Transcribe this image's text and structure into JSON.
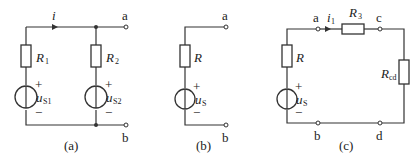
{
  "figures": [
    {
      "caption": "(a)",
      "current": "i",
      "terminals": [
        "a",
        "b"
      ],
      "resistors": [
        {
          "name": "R",
          "sub": "1"
        },
        {
          "name": "R",
          "sub": "2"
        }
      ],
      "sources": [
        {
          "name": "u",
          "sub": "S1",
          "plus": "+",
          "minus": "−"
        },
        {
          "name": "u",
          "sub": "S2",
          "plus": "+",
          "minus": "−"
        }
      ]
    },
    {
      "caption": "(b)",
      "terminals": [
        "a",
        "b"
      ],
      "resistors": [
        {
          "name": "R",
          "sub": ""
        }
      ],
      "sources": [
        {
          "name": "u",
          "sub": "S",
          "plus": "+",
          "minus": "−"
        }
      ]
    },
    {
      "caption": "(c)",
      "current": "i",
      "current_sub": "1",
      "terminals": [
        "a",
        "c",
        "b",
        "d"
      ],
      "resistors": [
        {
          "name": "R",
          "sub": ""
        },
        {
          "name": "R",
          "sub": "3"
        },
        {
          "name": "R",
          "sub": "cd"
        }
      ],
      "sources": [
        {
          "name": "u",
          "sub": "S",
          "plus": "+",
          "minus": "−"
        }
      ]
    }
  ]
}
